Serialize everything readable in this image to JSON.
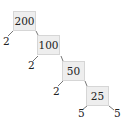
{
  "diagram": {
    "type": "factor-tree",
    "root": "200",
    "nodes": [
      {
        "value": "200",
        "factor": "2"
      },
      {
        "value": "100",
        "factor": "2"
      },
      {
        "value": "50",
        "factor": "2"
      },
      {
        "value": "25",
        "factor_left": "5",
        "factor_right": "5"
      }
    ],
    "colors": {
      "box_fill": "#eeeeee",
      "box_border": "#d6d6d6",
      "line": "#555555",
      "text": "#222222"
    }
  }
}
